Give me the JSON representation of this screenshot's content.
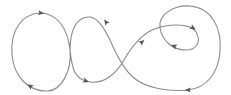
{
  "diagram": {
    "type": "directed-curve",
    "colors": {
      "stroke": "#8a8a8a",
      "arrow": "#555555",
      "background": "#ffffff"
    },
    "path": "M 70 50 C 72 70, 62 90, 48 91 C 30 92, 14 78, 12 55 C 10 30, 22 14, 40 13 C 58 13, 68 30, 70 50 C 72 68, 74 80, 90 82 C 104 84, 116 74, 124 60 C 132 46, 140 36, 152 30 C 166 24, 190 22, 196 32 C 202 42, 196 50, 186 50 C 172 50, 162 40, 160 28 C 158 14, 174 5, 190 6 C 212 8, 222 28, 220 52 C 218 74, 206 88, 188 90 C 168 92, 146 88, 134 78 C 124 70, 116 54, 110 40 C 104 28, 98 18, 90 17 C 78 16, 70 28, 70 50",
    "arrows": [
      {
        "id": "arrow-left-top",
        "x": 41,
        "y": 13,
        "angle": 5
      },
      {
        "id": "arrow-left-bottom",
        "x": 30,
        "y": 86,
        "angle": 215
      },
      {
        "id": "arrow-middle-bottom",
        "x": 86,
        "y": 81,
        "angle": 20
      },
      {
        "id": "arrow-middle-top",
        "x": 106,
        "y": 22,
        "angle": 235
      },
      {
        "id": "arrow-center-up",
        "x": 142,
        "y": 42,
        "angle": -40
      },
      {
        "id": "arrow-right-inner-top",
        "x": 193,
        "y": 28,
        "angle": 30
      },
      {
        "id": "arrow-right-inner-bottom",
        "x": 174,
        "y": 46,
        "angle": 200
      },
      {
        "id": "arrow-right-bottom",
        "x": 188,
        "y": 90,
        "angle": 180
      }
    ]
  }
}
